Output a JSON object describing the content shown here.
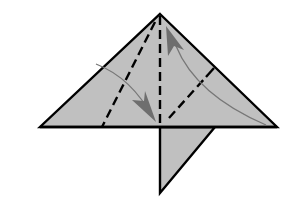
{
  "diagram": {
    "colors": {
      "paper": "#c0c0c0",
      "outline": "#000000",
      "arrow_line": "#777777",
      "arrow_head": "#6e6e6e",
      "background": "#ffffff"
    },
    "elements": [
      {
        "name": "main-triangle",
        "type": "shape"
      },
      {
        "name": "bottom-flap",
        "type": "shape"
      },
      {
        "name": "center-valley-fold",
        "type": "dashed-line"
      },
      {
        "name": "left-valley-fold",
        "type": "dashed-line"
      },
      {
        "name": "right-valley-fold",
        "type": "dashed-line"
      },
      {
        "name": "left-fold-arrow",
        "type": "arrow",
        "direction": "down-right"
      },
      {
        "name": "right-fold-arrow",
        "type": "arrow",
        "direction": "up-left"
      }
    ]
  }
}
